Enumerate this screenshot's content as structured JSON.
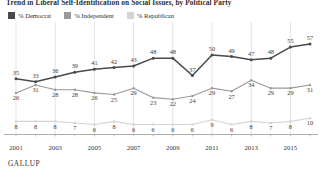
{
  "chart_title": "Trend in Liberal Self-Identification on Social Issues, by Political Party",
  "legend": {
    "items": [
      {
        "label": "% Democrat",
        "color": "#4a4a4a"
      },
      {
        "label": "% Independent",
        "color": "#9a9a9a"
      },
      {
        "label": "% Republican",
        "color": "#d4d4d4"
      }
    ]
  },
  "footer": "GALLUP",
  "axis": {
    "tick_labels": [
      "2001",
      "2003",
      "2005",
      "2007",
      "2009",
      "2011",
      "2013",
      "2015"
    ],
    "tick_years": [
      2001,
      2003,
      2005,
      2007,
      2009,
      2011,
      2013,
      2015
    ]
  },
  "chart_data": {
    "type": "line",
    "title": "Trend in Liberal Self-Identification on Social Issues, by Political Party",
    "xlabel": "",
    "ylabel": "",
    "x": [
      2001,
      2002,
      2003,
      2004,
      2005,
      2006,
      2007,
      2008,
      2009,
      2010,
      2011,
      2012,
      2013,
      2014,
      2015,
      2016
    ],
    "xlim": [
      2001,
      2016
    ],
    "ylim": [
      0,
      62
    ],
    "grid": true,
    "legend_position": "top-left",
    "series": [
      {
        "name": "% Democrat",
        "color": "#4a4a4a",
        "values": [
          35,
          33,
          36,
          39,
          41,
          42,
          43,
          48,
          48,
          37,
          50,
          49,
          47,
          48,
          55,
          57
        ]
      },
      {
        "name": "% Independent",
        "color": "#9a9a9a",
        "values": [
          26,
          31,
          28,
          28,
          26,
          25,
          29,
          23,
          22,
          24,
          29,
          27,
          34,
          29,
          29,
          31
        ]
      },
      {
        "name": "% Republican",
        "color": "#d4d4d4",
        "values": [
          8,
          8,
          8,
          7,
          6,
          8,
          6,
          6,
          6,
          6,
          9,
          6,
          8,
          7,
          8,
          10
        ]
      }
    ]
  }
}
